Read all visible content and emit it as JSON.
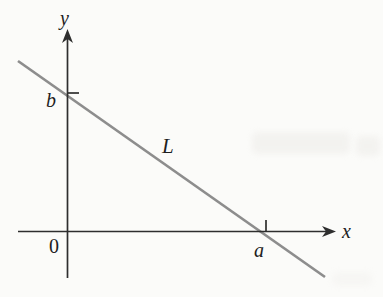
{
  "figure": {
    "axis_labels": {
      "x": "x",
      "y": "y"
    },
    "origin_label": "0",
    "line_label": "L",
    "x_intercept_label": "a",
    "y_intercept_label": "b"
  },
  "colors": {
    "background": "#fbfbf9",
    "axis": "#2e2e2e",
    "line": "#8d8d8d",
    "text": "#1e1e1e"
  }
}
